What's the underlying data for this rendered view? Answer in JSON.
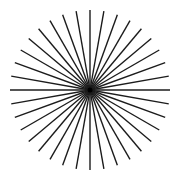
{
  "figure": {
    "type": "starburst",
    "line_count": 36,
    "angle_step_degrees": 10,
    "center": [
      90,
      90
    ],
    "radius": 80,
    "line_width": 1.4,
    "colors": {
      "background": "#ffffff",
      "line": "#1c1c1c",
      "center": "#000000"
    }
  }
}
